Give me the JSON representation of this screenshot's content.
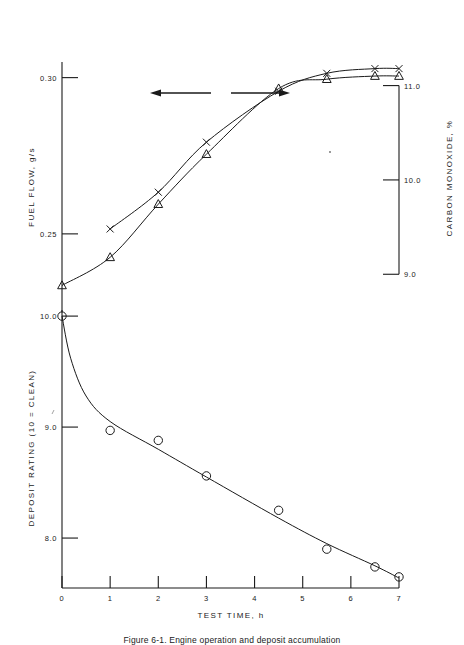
{
  "figure": {
    "caption": "Figure 6-1.  Engine operation and deposit accumulation",
    "background_color": "#ffffff",
    "ink_color": "#1a1a1a"
  },
  "chart_data": [
    {
      "type": "line",
      "panel": "upper",
      "title": "",
      "xlabel": "",
      "ylabel": "FUEL  FLOW,  g/s",
      "ylabel_right": "CARBON  MONOXIDE,  %",
      "xlim": [
        0,
        7
      ],
      "ylim": [
        0.225,
        0.305
      ],
      "ylim_right": [
        8.6,
        11.25
      ],
      "ytick_labels": [
        "0.30",
        "0.25"
      ],
      "ytick_values": [
        0.3,
        0.25
      ],
      "ytick_right_labels": [
        "11.0",
        "10.0",
        "9.0"
      ],
      "ytick_right_values": [
        11.0,
        10.0,
        9.0
      ],
      "grid": false,
      "legend": "none",
      "annotations": [
        {
          "name": "left-arrow",
          "points_to": "fuel-flow-axis",
          "direction": "left"
        },
        {
          "name": "right-arrow",
          "points_to": "carbon-monoxide-axis",
          "direction": "right"
        }
      ],
      "series": [
        {
          "name": "Fuel flow",
          "marker": "triangle",
          "axis": "left",
          "x": [
            0,
            1,
            2,
            3,
            4.5,
            5.5,
            6.5,
            7
          ],
          "values": [
            0.2335,
            0.2425,
            0.2595,
            0.2755,
            0.2965,
            0.2995,
            0.3005,
            0.3005
          ]
        },
        {
          "name": "Carbon monoxide",
          "marker": "x",
          "axis": "right",
          "x": [
            1,
            2,
            3,
            4.5,
            5.5,
            6.5,
            7
          ],
          "values": [
            9.48,
            9.87,
            10.4,
            10.94,
            11.13,
            11.18,
            11.18
          ]
        }
      ]
    },
    {
      "type": "line",
      "panel": "lower",
      "title": "",
      "xlabel": "TEST  TIME,  h",
      "ylabel": "DEPOSIT  RATING  (10 = CLEAN)",
      "xlim": [
        0,
        7
      ],
      "ylim": [
        7.55,
        10.1
      ],
      "xtick_labels": [
        "0",
        "1",
        "2",
        "3",
        "4",
        "5",
        "6",
        "7"
      ],
      "xtick_values": [
        0,
        1,
        2,
        3,
        4,
        5,
        6,
        7
      ],
      "ytick_labels": [
        "10.0",
        "9.0",
        "8.0"
      ],
      "ytick_values": [
        10.0,
        9.0,
        8.0
      ],
      "grid": false,
      "legend": "none",
      "series": [
        {
          "name": "Deposit rating",
          "marker": "circle",
          "axis": "left",
          "x": [
            0,
            1,
            2,
            3,
            4.5,
            5.5,
            6.5,
            7
          ],
          "values": [
            10.0,
            8.97,
            8.88,
            8.56,
            8.25,
            7.9,
            7.74,
            7.65
          ]
        }
      ]
    }
  ]
}
